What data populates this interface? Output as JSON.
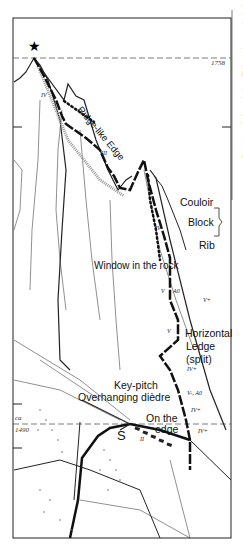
{
  "diagram": {
    "type": "climbing-route-topo",
    "summit_marker": "star-icon",
    "altitudes": {
      "top": "1758",
      "bottom_prefix": "ca",
      "bottom": "1490"
    },
    "labels": {
      "ridge": "Ridge-like Edge",
      "couloir": "Couloir",
      "block": "Block",
      "rib": "Rib",
      "window": "Window in the rock",
      "horizontal_ledge_1": "Horizontal",
      "horizontal_ledge_2": "Ledge",
      "horizontal_ledge_3": "(split)",
      "key_pitch": "Key-pitch",
      "overhanging": "Overhanging dièdre",
      "on_edge_1": "On the",
      "on_edge_2": "edge",
      "start": "S",
      "side_note": "On the right of the Edge (out of sight)"
    },
    "grades": [
      "IV",
      "III",
      "III",
      "IV",
      "V",
      "V+",
      "V",
      "IV+",
      "V-, A0",
      "IV+",
      "IV+",
      "II"
    ],
    "grade_aid": [
      "A0"
    ]
  }
}
